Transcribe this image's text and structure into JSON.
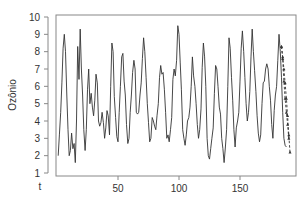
{
  "chart_data": {
    "type": "line",
    "title": "",
    "xlabel": "t",
    "ylabel": "Ozônio",
    "xlim": [
      0,
      195
    ],
    "ylim": [
      1,
      10
    ],
    "x_ticks": [
      50,
      100,
      150
    ],
    "y_ticks": [
      1,
      2,
      3,
      4,
      5,
      6,
      7,
      8,
      9,
      10
    ],
    "grid": false,
    "legend": "none",
    "series": [
      {
        "name": "observed",
        "style": "solid",
        "color": "#333333",
        "x_start": 1,
        "values": [
          2.0,
          3.2,
          4.5,
          6.2,
          8.2,
          9.0,
          8.0,
          5.5,
          3.5,
          2.0,
          2.3,
          3.3,
          2.4,
          2.7,
          1.6,
          4.0,
          8.3,
          6.4,
          9.3,
          7.0,
          5.5,
          3.5,
          2.3,
          3.5,
          5.8,
          7.0,
          5.0,
          5.6,
          4.8,
          4.3,
          5.2,
          6.7,
          6.2,
          4.0,
          3.7,
          3.9,
          4.5,
          3.9,
          3.0,
          3.6,
          4.6,
          4.3,
          3.2,
          6.0,
          8.5,
          8.0,
          5.4,
          4.2,
          3.1,
          2.8,
          4.5,
          6.0,
          7.7,
          7.9,
          6.3,
          5.5,
          3.8,
          2.7,
          3.0,
          4.5,
          5.5,
          6.8,
          7.5,
          7.0,
          4.5,
          4.4,
          4.5,
          5.5,
          6.2,
          7.6,
          8.8,
          8.0,
          6.5,
          5.0,
          3.9,
          2.8,
          3.0,
          4.2,
          4.0,
          3.7,
          3.5,
          4.3,
          5.0,
          6.5,
          7.2,
          6.7,
          6.8,
          5.8,
          4.5,
          3.0,
          3.2,
          2.8,
          3.5,
          4.2,
          6.4,
          7.0,
          6.6,
          7.5,
          9.5,
          9.0,
          7.4,
          5.8,
          3.5,
          3.0,
          2.6,
          3.2,
          4.0,
          4.2,
          4.8,
          6.0,
          7.7,
          6.6,
          6.0,
          5.0,
          3.8,
          3.0,
          3.5,
          4.7,
          7.1,
          8.5,
          7.7,
          6.0,
          3.0,
          2.0,
          1.8,
          2.4,
          3.0,
          3.6,
          5.6,
          7.2,
          7.0,
          6.0,
          4.8,
          4.4,
          3.0,
          2.4,
          1.6,
          2.5,
          3.5,
          6.0,
          8.8,
          8.2,
          6.5,
          5.2,
          3.5,
          2.5,
          3.6,
          4.0,
          4.5,
          6.3,
          8.2,
          9.2,
          8.0,
          6.5,
          5.0,
          4.0,
          4.5,
          5.7,
          7.7,
          9.3,
          8.0,
          6.9,
          5.7,
          4.3,
          3.3,
          2.8,
          3.2,
          5.0,
          6.2,
          6.3,
          7.0,
          7.3,
          7.0,
          6.0,
          5.2,
          3.8,
          3.0,
          4.6,
          5.5,
          6.0,
          7.5,
          9.0,
          8.0,
          6.5,
          4.5,
          3.0,
          2.6,
          2.5
        ]
      },
      {
        "name": "forecast-a",
        "style": "dashed",
        "markers": true,
        "color": "#333333",
        "x": [
          184,
          185,
          186,
          187,
          188,
          189,
          190
        ],
        "values": [
          8.3,
          7.6,
          6.3,
          5.3,
          4.5,
          3.8,
          3.0
        ]
      },
      {
        "name": "forecast-b",
        "style": "dashed",
        "markers": true,
        "color": "#333333",
        "x": [
          184,
          185,
          186,
          187,
          188,
          189,
          190,
          191
        ],
        "values": [
          8.3,
          7.7,
          7.0,
          6.2,
          5.3,
          4.3,
          3.2,
          2.2
        ]
      }
    ]
  },
  "plot": {
    "frame": {
      "left": 56,
      "top": 15,
      "right": 296,
      "bottom": 176
    },
    "axis_color": "#888888",
    "line_color": "#333333"
  }
}
